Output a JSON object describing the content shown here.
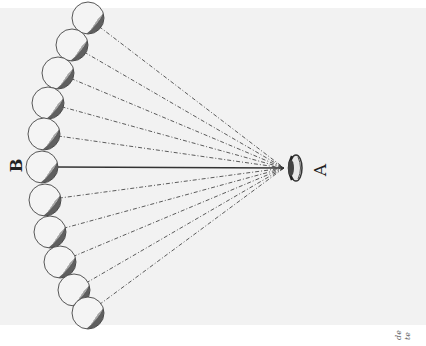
{
  "figure": {
    "labels": {
      "b": "B",
      "a": "A"
    },
    "corner_text": {
      "line1": "de",
      "line2": "te"
    },
    "eye": {
      "x": 288,
      "y": 168
    },
    "spheres": [
      {
        "x": 88,
        "y": 18,
        "line": "dashed"
      },
      {
        "x": 72,
        "y": 45,
        "line": "dashed"
      },
      {
        "x": 58,
        "y": 73,
        "line": "dashed"
      },
      {
        "x": 48,
        "y": 103,
        "line": "dashed"
      },
      {
        "x": 44,
        "y": 134,
        "line": "dashed"
      },
      {
        "x": 42,
        "y": 167,
        "line": "solid"
      },
      {
        "x": 45,
        "y": 200,
        "line": "dashed"
      },
      {
        "x": 50,
        "y": 232,
        "line": "dashed"
      },
      {
        "x": 60,
        "y": 262,
        "line": "dashed"
      },
      {
        "x": 74,
        "y": 290,
        "line": "dashed"
      },
      {
        "x": 88,
        "y": 313,
        "line": "dashed"
      }
    ],
    "colors": {
      "plate": "#f2f2f2",
      "ink": "#333333"
    }
  }
}
